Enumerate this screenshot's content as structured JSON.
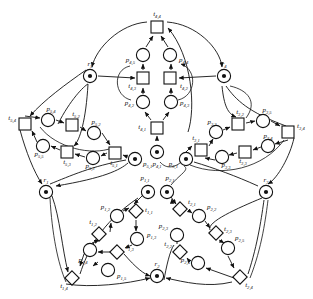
{
  "figure": {
    "kind": "petri-net",
    "title": "",
    "colors": {
      "stroke": "#111111",
      "fill": "#ffffff",
      "token": "#111111",
      "background": "#ffffff"
    }
  },
  "resources": [
    {
      "id": "r1",
      "label": "r",
      "sub": "1",
      "tokens": 1,
      "x": 46,
      "y": 192
    },
    {
      "id": "r2",
      "label": "r",
      "sub": "2",
      "tokens": 1,
      "x": 157,
      "y": 276
    },
    {
      "id": "r3",
      "label": "r",
      "sub": "3",
      "tokens": 1,
      "x": 266,
      "y": 192
    },
    {
      "id": "r4",
      "label": "r",
      "sub": "4",
      "tokens": 1,
      "x": 224,
      "y": 76
    },
    {
      "id": "r5",
      "label": "r",
      "sub": "5",
      "tokens": 1,
      "x": 90,
      "y": 76
    }
  ],
  "modules": [
    {
      "id": "module-1",
      "places": [
        {
          "id": "p1_1",
          "label": "p",
          "sub": "1,1",
          "tokens": 1,
          "x": 148,
          "y": 192,
          "lx": 145,
          "ly": 180,
          "anchor": "middle"
        },
        {
          "id": "p1_2",
          "label": "p",
          "sub": "1,2",
          "tokens": 0,
          "x": 117,
          "y": 216,
          "lx": 110,
          "ly": 209,
          "anchor": "end"
        },
        {
          "id": "p1_3",
          "label": "p",
          "sub": "1,3",
          "tokens": 0,
          "x": 137,
          "y": 239,
          "lx": 147,
          "ly": 237,
          "anchor": "start"
        },
        {
          "id": "p1_4",
          "label": "p",
          "sub": "1,4",
          "tokens": 0,
          "x": 90,
          "y": 250,
          "lx": 83,
          "ly": 262,
          "anchor": "middle"
        },
        {
          "id": "p1_5",
          "label": "p",
          "sub": "1,5",
          "tokens": 0,
          "x": 108,
          "y": 270,
          "lx": 117,
          "ly": 278,
          "anchor": "start"
        }
      ],
      "transitions": [
        {
          "id": "t1_1",
          "label": "t",
          "sub": "1,1",
          "x": 136,
          "y": 211,
          "lx": 145,
          "ly": 212,
          "anchor": "start",
          "shape": "diamond"
        },
        {
          "id": "t1_2",
          "label": "t",
          "sub": "1,2",
          "x": 99,
          "y": 234,
          "lx": 93,
          "ly": 224,
          "anchor": "middle",
          "shape": "diamond"
        },
        {
          "id": "t1_3",
          "label": "t",
          "sub": "1,3",
          "x": 117,
          "y": 252,
          "lx": 126,
          "ly": 249,
          "anchor": "start",
          "shape": "diamond"
        },
        {
          "id": "t1_4",
          "label": "t",
          "sub": "1,4",
          "x": 72,
          "y": 278,
          "lx": 64,
          "ly": 288,
          "anchor": "middle",
          "shape": "diamond"
        }
      ]
    },
    {
      "id": "module-2",
      "places": [
        {
          "id": "p2_1",
          "label": "p",
          "sub": "2,1",
          "tokens": 1,
          "x": 167,
          "y": 192,
          "lx": 170,
          "ly": 180,
          "anchor": "middle"
        },
        {
          "id": "p2_2",
          "label": "p",
          "sub": "2,2",
          "tokens": 0,
          "x": 199,
          "y": 216,
          "lx": 207,
          "ly": 209,
          "anchor": "start"
        },
        {
          "id": "p2_3",
          "label": "p",
          "sub": "2,3",
          "tokens": 0,
          "x": 177,
          "y": 235,
          "lx": 168,
          "ly": 228,
          "anchor": "end"
        },
        {
          "id": "p2_4",
          "label": "p",
          "sub": "2,4",
          "tokens": 0,
          "x": 198,
          "y": 263,
          "lx": 190,
          "ly": 262,
          "anchor": "end"
        },
        {
          "id": "p2_5",
          "label": "p",
          "sub": "2,5",
          "tokens": 0,
          "x": 228,
          "y": 248,
          "lx": 235,
          "ly": 240,
          "anchor": "start"
        }
      ],
      "transitions": [
        {
          "id": "t2_1",
          "label": "t",
          "sub": "2,1",
          "x": 180,
          "y": 209,
          "lx": 188,
          "ly": 204,
          "anchor": "start",
          "shape": "diamond"
        },
        {
          "id": "t2_2",
          "label": "t",
          "sub": "2,2",
          "x": 180,
          "y": 252,
          "lx": 172,
          "ly": 246,
          "anchor": "end",
          "shape": "diamond"
        },
        {
          "id": "t2_3",
          "label": "t",
          "sub": "2,3",
          "x": 216,
          "y": 233,
          "lx": 224,
          "ly": 231,
          "anchor": "start",
          "shape": "diamond"
        },
        {
          "id": "t2_4",
          "label": "t",
          "sub": "2,4",
          "x": 240,
          "y": 277,
          "lx": 249,
          "ly": 287,
          "anchor": "middle",
          "shape": "diamond"
        }
      ]
    },
    {
      "id": "module-3",
      "places": [
        {
          "id": "p3_1",
          "label": "p",
          "sub": "3,1",
          "tokens": 1,
          "x": 186,
          "y": 159,
          "lx": 178,
          "ly": 166,
          "anchor": "end"
        },
        {
          "id": "p3_2",
          "label": "p",
          "sub": "3,2",
          "tokens": 0,
          "x": 216,
          "y": 132,
          "lx": 212,
          "ly": 124,
          "anchor": "middle"
        },
        {
          "id": "p3_3",
          "label": "p",
          "sub": "3,3",
          "tokens": 0,
          "x": 222,
          "y": 157,
          "lx": 226,
          "ly": 167,
          "anchor": "middle"
        },
        {
          "id": "p3_4",
          "label": "p",
          "sub": "3,4",
          "tokens": 0,
          "x": 268,
          "y": 146,
          "lx": 268,
          "ly": 138,
          "anchor": "middle"
        },
        {
          "id": "p3_5",
          "label": "p",
          "sub": "3,5",
          "tokens": 0,
          "x": 263,
          "y": 121,
          "lx": 267,
          "ly": 112,
          "anchor": "middle"
        }
      ],
      "transitions": [
        {
          "id": "t3_1",
          "label": "t",
          "sub": "3,1",
          "x": 201,
          "y": 150,
          "lx": 196,
          "ly": 140,
          "anchor": "middle",
          "shape": "square"
        },
        {
          "id": "t3_2",
          "label": "t",
          "sub": "3,2",
          "x": 238,
          "y": 124,
          "lx": 240,
          "ly": 114,
          "anchor": "middle",
          "shape": "square"
        },
        {
          "id": "t3_3",
          "label": "t",
          "sub": "3,3",
          "x": 245,
          "y": 152,
          "lx": 243,
          "ly": 163,
          "anchor": "middle",
          "shape": "square"
        },
        {
          "id": "t3_4",
          "label": "t",
          "sub": "3,4",
          "x": 288,
          "y": 132,
          "lx": 297,
          "ly": 128,
          "anchor": "start",
          "shape": "square"
        }
      ]
    },
    {
      "id": "module-4",
      "places": [
        {
          "id": "p4_1",
          "label": "p",
          "sub": "4,1",
          "tokens": 1,
          "x": 157,
          "y": 152,
          "lx": 157,
          "ly": 166,
          "anchor": "middle"
        },
        {
          "id": "p4_2",
          "label": "p",
          "sub": "4,2",
          "tokens": 0,
          "x": 143,
          "y": 102,
          "lx": 134,
          "ly": 105,
          "anchor": "end"
        },
        {
          "id": "p4_3",
          "label": "p",
          "sub": "4,3",
          "tokens": 0,
          "x": 171,
          "y": 102,
          "lx": 180,
          "ly": 105,
          "anchor": "start"
        },
        {
          "id": "p4_4",
          "label": "p",
          "sub": "4,4",
          "tokens": 0,
          "x": 170,
          "y": 55,
          "lx": 179,
          "ly": 62,
          "anchor": "start"
        },
        {
          "id": "p4_5",
          "label": "p",
          "sub": "4,5",
          "tokens": 0,
          "x": 143,
          "y": 55,
          "lx": 135,
          "ly": 62,
          "anchor": "end"
        }
      ],
      "transitions": [
        {
          "id": "t4_1",
          "label": "t",
          "sub": "4,1",
          "x": 157,
          "y": 128,
          "lx": 146,
          "ly": 129,
          "anchor": "end",
          "shape": "square"
        },
        {
          "id": "t4_2",
          "label": "t",
          "sub": "4,2",
          "x": 170,
          "y": 78,
          "lx": 180,
          "ly": 88,
          "anchor": "start",
          "shape": "square"
        },
        {
          "id": "t4_3",
          "label": "t",
          "sub": "4,3",
          "x": 143,
          "y": 78,
          "lx": 136,
          "ly": 88,
          "anchor": "end",
          "shape": "square"
        },
        {
          "id": "t4_4",
          "label": "t",
          "sub": "4,4",
          "x": 157,
          "y": 27,
          "lx": 157,
          "ly": 16,
          "anchor": "middle",
          "shape": "square"
        }
      ]
    },
    {
      "id": "module-5",
      "places": [
        {
          "id": "p5_1",
          "label": "p",
          "sub": "5,1",
          "tokens": 1,
          "x": 135,
          "y": 159,
          "lx": 143,
          "ly": 166,
          "anchor": "start"
        },
        {
          "id": "p5_2",
          "label": "p",
          "sub": "5,2",
          "tokens": 0,
          "x": 94,
          "y": 133,
          "lx": 96,
          "ly": 124,
          "anchor": "middle"
        },
        {
          "id": "p5_3",
          "label": "p",
          "sub": "5,3",
          "tokens": 0,
          "x": 93,
          "y": 158,
          "lx": 90,
          "ly": 168,
          "anchor": "middle"
        },
        {
          "id": "p5_4",
          "label": "p",
          "sub": "5,4",
          "tokens": 0,
          "x": 48,
          "y": 120,
          "lx": 51,
          "ly": 111,
          "anchor": "middle"
        },
        {
          "id": "p5_5",
          "label": "p",
          "sub": "5,5",
          "tokens": 0,
          "x": 43,
          "y": 146,
          "lx": 39,
          "ly": 156,
          "anchor": "middle"
        }
      ],
      "transitions": [
        {
          "id": "t5_1",
          "label": "t",
          "sub": "5,1",
          "x": 115,
          "y": 153,
          "lx": 114,
          "ly": 165,
          "anchor": "middle",
          "shape": "square"
        },
        {
          "id": "t5_2",
          "label": "t",
          "sub": "5,2",
          "x": 72,
          "y": 125,
          "lx": 76,
          "ly": 116,
          "anchor": "middle",
          "shape": "square"
        },
        {
          "id": "t5_3",
          "label": "t",
          "sub": "5,3",
          "x": 67,
          "y": 152,
          "lx": 67,
          "ly": 164,
          "anchor": "middle",
          "shape": "square"
        },
        {
          "id": "t5_4",
          "label": "t",
          "sub": "5,4",
          "x": 25,
          "y": 124,
          "lx": 16,
          "ly": 120,
          "anchor": "end",
          "shape": "square"
        }
      ]
    }
  ]
}
